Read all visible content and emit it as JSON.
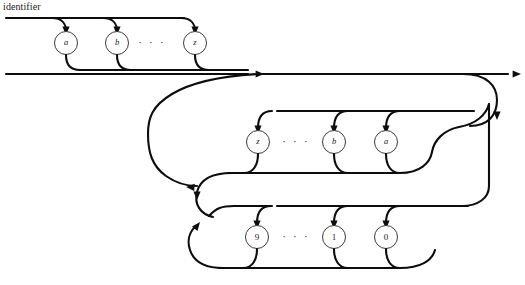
{
  "diagram": {
    "title": "identifier",
    "type": "railroad-syntax-diagram",
    "background_color": "#ffffff",
    "line_color": "#0d0d0d",
    "node_fill_color": "#ffffff",
    "node_stroke_color": "#3a3a3a",
    "ellipsis": "· · ·",
    "rows": [
      {
        "id": "letters-first",
        "direction": "left-to-right",
        "nodes": [
          {
            "label": "a",
            "kind": "letter",
            "cx": 66,
            "cy": 43
          },
          {
            "label": "b",
            "kind": "letter",
            "cx": 117,
            "cy": 43
          },
          {
            "label": "· · ·",
            "kind": "ellipsis",
            "cx": 152,
            "cy": 43
          },
          {
            "label": "z",
            "kind": "letter",
            "cx": 195,
            "cy": 43
          }
        ]
      },
      {
        "id": "letters-repeat",
        "direction": "right-to-left",
        "nodes": [
          {
            "label": "z",
            "kind": "letter",
            "cx": 258,
            "cy": 142
          },
          {
            "label": "· · ·",
            "kind": "ellipsis",
            "cx": 296,
            "cy": 142
          },
          {
            "label": "b",
            "kind": "letter",
            "cx": 334,
            "cy": 142
          },
          {
            "label": "a",
            "kind": "letter",
            "cx": 386,
            "cy": 142
          }
        ]
      },
      {
        "id": "digits-repeat",
        "direction": "right-to-left",
        "nodes": [
          {
            "label": "9",
            "kind": "digit",
            "cx": 257,
            "cy": 237
          },
          {
            "label": "· · ·",
            "kind": "ellipsis",
            "cx": 296,
            "cy": 237
          },
          {
            "label": "1",
            "kind": "digit",
            "cx": 334,
            "cy": 237
          },
          {
            "label": "0",
            "kind": "digit",
            "cx": 386,
            "cy": 237
          }
        ]
      }
    ],
    "main_line_y": 74,
    "entry_line_y": 18
  }
}
